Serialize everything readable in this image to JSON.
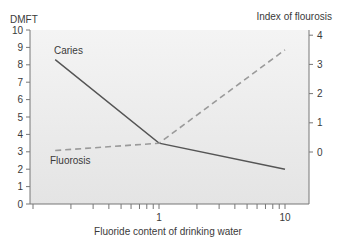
{
  "chart_data": {
    "type": "line",
    "title": "",
    "xlabel": "Fluoride content of drinking water",
    "xscale": "log",
    "xlim": [
      0.1,
      15
    ],
    "x_tick_labels": [
      {
        "value": 1,
        "label": "1"
      },
      {
        "value": 10,
        "label": "10"
      }
    ],
    "ylabel_left": "DMFT",
    "ylim_left": [
      0,
      10
    ],
    "y_ticks_left": [
      0,
      1,
      2,
      3,
      4,
      5,
      6,
      7,
      8,
      9,
      10
    ],
    "ylabel_right": "Index of flourosis",
    "ylim_right": [
      -1.8,
      4.2
    ],
    "y_ticks_right": [
      0,
      1,
      2,
      3,
      4
    ],
    "grid": false,
    "series": [
      {
        "name": "Caries",
        "axis": "left",
        "style": "solid",
        "color": "#555555",
        "x": [
          0.15,
          1,
          10
        ],
        "values": [
          8.3,
          3.5,
          2.0
        ]
      },
      {
        "name": "Fluorosis",
        "axis": "right",
        "style": "dashed",
        "color": "#9a9a9a",
        "x": [
          0.15,
          1,
          10
        ],
        "values": [
          0.05,
          0.3,
          3.5
        ]
      }
    ],
    "annotations": [
      {
        "text": "Caries",
        "near_series": "Caries"
      },
      {
        "text": "Fluorosis",
        "near_series": "Fluorosis"
      }
    ]
  },
  "labels": {
    "left_axis": "DMFT",
    "right_axis": "Index of flourosis",
    "x_axis": "Fluoride content of drinking water",
    "caries": "Caries",
    "fluorosis": "Fluorosis"
  }
}
